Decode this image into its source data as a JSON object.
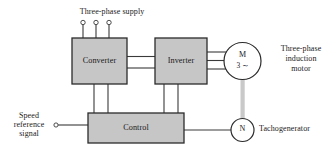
{
  "diagram": {
    "colors": {
      "block_fill": "#c6c6c6",
      "block_border": "#2b2b2b",
      "line": "#3a3a3a",
      "shaft": "#c9c9c9",
      "text": "#1a1a1a",
      "background": "#ffffff"
    },
    "blocks": [
      {
        "id": "converter",
        "label": "Converter"
      },
      {
        "id": "inverter",
        "label": "Inverter"
      },
      {
        "id": "control",
        "label": "Control"
      }
    ],
    "machines": [
      {
        "id": "motor",
        "letter": "M",
        "sub": "3 ∼"
      },
      {
        "id": "tachogenerator",
        "letter": "N",
        "sub": ""
      }
    ],
    "labels": {
      "supply": "Three-phase supply",
      "motor_line1": "Three-phase",
      "motor_line2": "induction",
      "motor_line3": "motor",
      "speed_line1": "Speed",
      "speed_line2": "reference",
      "speed_line3": "signal",
      "tacho": "Tachogenerator"
    },
    "connections": {
      "supply_phases": 3,
      "dc_link_lines": 2,
      "motor_phase_lines": 3,
      "control_feed_lines": 4,
      "shaft": "motor-to-tachogenerator"
    }
  }
}
